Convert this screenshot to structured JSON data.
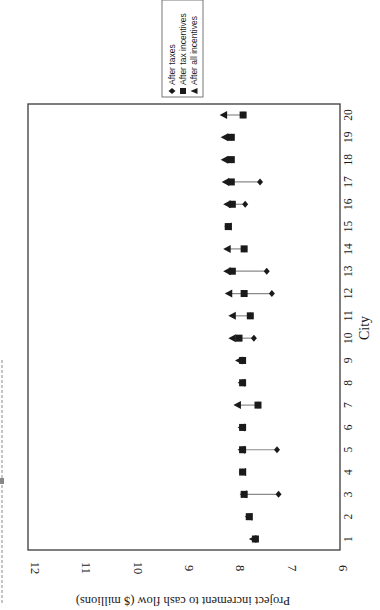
{
  "chart_data": {
    "type": "scatter",
    "orientation": "rotated-90-ccw",
    "title": "",
    "xlabel": "City",
    "ylabel": "Project increment to cash flow ($ millions)",
    "ylim": [
      6,
      12
    ],
    "yticks": [
      6,
      7,
      8,
      9,
      10,
      11,
      12
    ],
    "categories": [
      1,
      2,
      3,
      4,
      5,
      6,
      7,
      8,
      9,
      10,
      11,
      12,
      13,
      14,
      15,
      16,
      17,
      18,
      19,
      20
    ],
    "grid": false,
    "legend_position": "top-right (rotated)",
    "series": [
      {
        "name": "After taxes",
        "marker": "diamond",
        "values": [
          7.55,
          7.67,
          7.1,
          7.8,
          7.13,
          7.8,
          7.5,
          7.8,
          7.8,
          7.58,
          7.65,
          7.23,
          7.33,
          7.77,
          8.08,
          7.75,
          7.46,
          8.02,
          8.02,
          7.79
        ]
      },
      {
        "name": "After tax incentives",
        "marker": "square",
        "values": [
          7.55,
          7.67,
          7.77,
          7.8,
          7.8,
          7.8,
          7.5,
          7.8,
          7.8,
          7.87,
          7.65,
          7.77,
          8.0,
          7.77,
          8.08,
          8.0,
          8.02,
          8.02,
          8.02,
          7.79
        ]
      },
      {
        "name": "After all incentives",
        "marker": "triangle",
        "values": [
          7.6,
          7.68,
          7.78,
          7.8,
          7.82,
          7.82,
          7.9,
          7.82,
          7.87,
          8.0,
          8.0,
          8.07,
          8.1,
          8.1,
          8.08,
          8.1,
          8.13,
          8.15,
          8.15,
          8.17
        ]
      }
    ]
  },
  "legend": {
    "items": [
      "After taxes",
      "After tax incentives",
      "After all incentives"
    ]
  },
  "axes": {
    "value_axis_label": "Project increment to cash flow ($ millions)",
    "category_axis_label": "City"
  },
  "colors": {
    "ink": "#1a1a1a",
    "connector": "#8a8a8a",
    "frame": "#3a3a3a",
    "clipped_title": "#b5b5b5"
  }
}
